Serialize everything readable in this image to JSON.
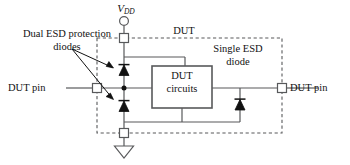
{
  "figure": {
    "width": 350,
    "height": 165,
    "background": "#ffffff",
    "line_color": "#58595b",
    "text_color": "#111111",
    "fill_color": "#111111"
  },
  "labels": {
    "dual_esd": "Dual ESD protection diodes",
    "vdd_symbol": "V",
    "vdd_subscript": "DD",
    "dut_top": "DUT",
    "single_esd": "Single ESD diode",
    "dut_circuits_line1": "DUT",
    "dut_circuits_line2": "circuits",
    "pin_left": "DUT pin",
    "pin_right": "DUT pin"
  },
  "components": {
    "dut_boundary": {
      "name": "DUT boundary",
      "style": "dashed",
      "x": 97,
      "y": 38,
      "width": 185,
      "height": 95
    },
    "dut_circuits_box": {
      "name": "DUT circuits",
      "style": "solid",
      "x": 152,
      "y": 66,
      "width": 60,
      "height": 42
    },
    "terminals": [
      {
        "name": "vdd-terminal",
        "x": 124,
        "y": 38,
        "shape": "square"
      },
      {
        "name": "gnd-terminal",
        "x": 124,
        "y": 133,
        "shape": "square"
      },
      {
        "name": "dut-pin-left-terminal",
        "x": 97,
        "y": 88,
        "shape": "square"
      },
      {
        "name": "dut-pin-right-terminal",
        "x": 282,
        "y": 88,
        "shape": "square"
      }
    ],
    "vdd_node": {
      "name": "vdd-open-circle",
      "x": 124,
      "y": 21,
      "shape": "circle"
    },
    "ground_symbol": {
      "name": "ground-triangle",
      "x": 124,
      "y": 146
    },
    "diodes": [
      {
        "name": "esd-diode-upper",
        "x": 124,
        "y": 70,
        "direction": "up"
      },
      {
        "name": "esd-diode-lower",
        "x": 124,
        "y": 106,
        "direction": "up"
      },
      {
        "name": "single-esd-diode",
        "x": 240,
        "y": 104,
        "direction": "up"
      }
    ],
    "junction_dots": [
      {
        "name": "pin-node-dot",
        "x": 124,
        "y": 88
      }
    ],
    "callout_arrows": [
      {
        "name": "callout-arrow-upper-diode",
        "from_x": 72,
        "from_y": 50,
        "to_x": 115,
        "to_y": 68
      },
      {
        "name": "callout-arrow-lower-diode",
        "from_x": 72,
        "from_y": 50,
        "to_x": 115,
        "to_y": 99
      }
    ]
  }
}
